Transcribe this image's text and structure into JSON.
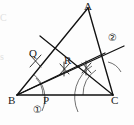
{
  "figure": {
    "type": "geometry-construction",
    "canvas": {
      "width": 134,
      "height": 125
    },
    "background_color": "#fdfdfd",
    "ink_color": "#1a1a1a",
    "construction_color": "#555555"
  },
  "vertices": [
    {
      "id": "A",
      "label": "A",
      "x": 88,
      "y": 8,
      "label_x": 84,
      "label_y": 2
    },
    {
      "id": "B",
      "label": "B",
      "x": 17,
      "y": 95,
      "label_x": 9,
      "label_y": 97
    },
    {
      "id": "C",
      "label": "C",
      "x": 113,
      "y": 95,
      "label_x": 112,
      "label_y": 97
    }
  ],
  "points": [
    {
      "id": "Q",
      "label": "Q",
      "x": 36,
      "y": 60,
      "label_x": 30,
      "label_y": 49
    },
    {
      "id": "R",
      "label": "R",
      "x": 66,
      "y": 68,
      "label_x": 66,
      "label_y": 56
    },
    {
      "id": "P",
      "label": "P",
      "x": 43,
      "y": 95,
      "label_x": 44,
      "label_y": 96
    }
  ],
  "annotations": [
    {
      "id": "mark-1",
      "label": "①",
      "x": 38,
      "y": 110,
      "note": "circled one, below BC near P"
    },
    {
      "id": "mark-2",
      "label": "②",
      "x": 112,
      "y": 38,
      "note": "circled two, right of AC"
    }
  ],
  "edge_artifacts": [
    {
      "id": "ghost-c",
      "label": "C",
      "x": 1,
      "y": 14
    },
    {
      "id": "ghost-s",
      "label": "s",
      "x": 1,
      "y": 53
    }
  ],
  "segments": [
    {
      "id": "AB",
      "from": "A",
      "to": "B",
      "style": "solid"
    },
    {
      "id": "BC",
      "from": "B",
      "to": "C",
      "style": "solid"
    },
    {
      "id": "CA",
      "from": "C",
      "to": "A",
      "style": "solid"
    },
    {
      "id": "bisector-B",
      "from": "B",
      "to": "ray-through-R-to-AC",
      "style": "solid"
    },
    {
      "id": "bisector-C",
      "from": "C",
      "to": "ray-through-Q-to-AB",
      "style": "solid"
    },
    {
      "id": "transversal-2",
      "from": "left-of-Q",
      "to": "beyond-AC-right",
      "style": "solid"
    }
  ],
  "construction_marks": {
    "arcs": [
      {
        "id": "arc-B-inner",
        "center": "B",
        "radius": 26,
        "note": "arc crossing AB and BC from B"
      },
      {
        "id": "arc-B-outer",
        "center": "B",
        "radius": 30,
        "note": "arc through P below BC"
      },
      {
        "id": "arc-C-inner",
        "center": "C",
        "radius": 30,
        "note": "arc crossing CA and CB from C"
      },
      {
        "id": "arc-C-outer",
        "center": "C",
        "radius": 36,
        "note": "arc below BC"
      },
      {
        "id": "arc-right",
        "center": "C",
        "radius": 22,
        "note": "short arc right of bisector near AC"
      }
    ],
    "tick_crosses": [
      {
        "id": "tick-R",
        "x": 64,
        "y": 69
      },
      {
        "id": "tick-mid",
        "x": 86,
        "y": 68
      },
      {
        "id": "tick-Q",
        "x": 35,
        "y": 61
      }
    ]
  },
  "labels_summary": {
    "vertex_labels": [
      "A",
      "B",
      "C"
    ],
    "point_labels": [
      "Q",
      "R",
      "P"
    ],
    "circled_numbers": [
      "①",
      "②"
    ]
  }
}
